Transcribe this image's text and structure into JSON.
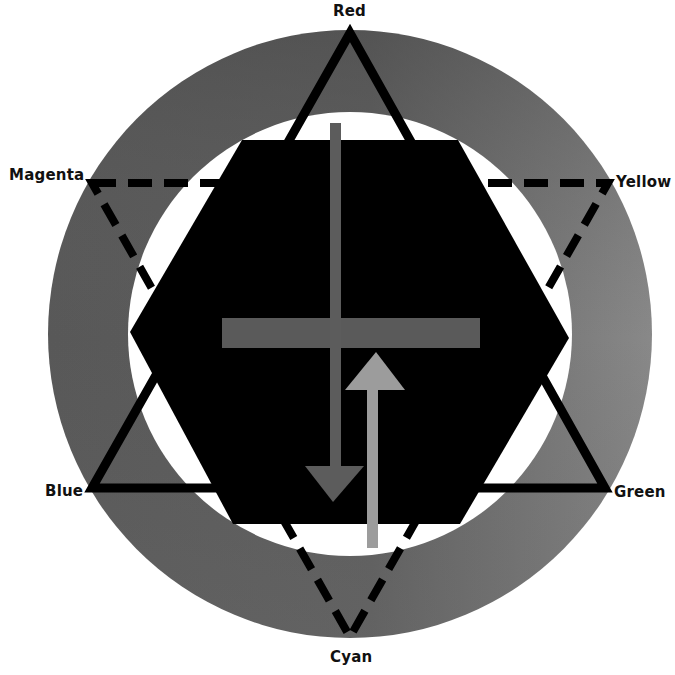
{
  "diagram": {
    "canvas": {
      "width": 675,
      "height": 675,
      "background": "#ffffff"
    },
    "ring": {
      "cx": 350,
      "cy": 334,
      "outer_rx": 302,
      "outer_ry": 304,
      "inner_r": 222,
      "gradient": {
        "top": "#474747",
        "left": "#575757",
        "right": "#8c8c8c",
        "bottom": "#6e6e6e"
      }
    },
    "hexagon": {
      "fill": "#000000",
      "points": [
        [
          242,
          140
        ],
        [
          458,
          140
        ],
        [
          569,
          338
        ],
        [
          460,
          524
        ],
        [
          233,
          524
        ],
        [
          130,
          332
        ]
      ]
    },
    "triangles": {
      "additive": {
        "style": "solid",
        "stroke": "#000000",
        "stroke_width": 9,
        "points": [
          [
            350,
            33
          ],
          [
            605,
            488
          ],
          [
            92,
            488
          ]
        ],
        "vertex_labels": [
          "Red",
          "Green",
          "Blue"
        ]
      },
      "subtractive": {
        "style": "dashed",
        "stroke": "#000000",
        "stroke_width": 8,
        "dash": "24 12",
        "points": [
          [
            92,
            183
          ],
          [
            608,
            183
          ],
          [
            350,
            637
          ]
        ],
        "vertex_labels": [
          "Magenta",
          "Yellow",
          "Cyan"
        ]
      }
    },
    "labels": [
      {
        "id": "red",
        "text": "Red",
        "x": 333,
        "y": 4
      },
      {
        "id": "yellow",
        "text": "Yellow",
        "x": 616,
        "y": 175
      },
      {
        "id": "green",
        "text": "Green",
        "x": 614,
        "y": 485
      },
      {
        "id": "cyan",
        "text": "Cyan",
        "x": 330,
        "y": 650
      },
      {
        "id": "blue",
        "text": "Blue",
        "x": 45,
        "y": 484
      },
      {
        "id": "magenta",
        "text": "Magenta",
        "x": 9,
        "y": 168
      }
    ],
    "crossbar": {
      "x": 222,
      "y": 318,
      "width": 258,
      "height": 30,
      "fill": "#5a5a5a"
    },
    "arrow_down": {
      "shaft": {
        "x": 330,
        "y": 123,
        "width": 11,
        "height": 345
      },
      "head": [
        [
          305,
          466
        ],
        [
          364,
          466
        ],
        [
          333,
          502
        ]
      ],
      "fill": "#5c5c5c",
      "direction": "down"
    },
    "arrow_up": {
      "shaft": {
        "x": 367,
        "y": 388,
        "width": 11,
        "height": 160
      },
      "head": [
        [
          345,
          390
        ],
        [
          405,
          390
        ],
        [
          376,
          352
        ]
      ],
      "fill": "#9c9c9c",
      "direction": "up"
    }
  }
}
